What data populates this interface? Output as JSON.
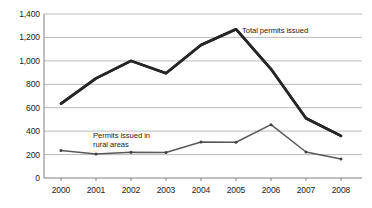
{
  "chart_data": {
    "type": "line",
    "title": "",
    "subtitle": "",
    "xlabel": "",
    "ylabel": "",
    "categories": [
      "2000",
      "2001",
      "2002",
      "2003",
      "2004",
      "2005",
      "2006",
      "2007",
      "2008"
    ],
    "ylim": [
      0,
      1400
    ],
    "yticks": [
      0,
      200,
      400,
      600,
      800,
      1000,
      1200,
      1400
    ],
    "ytick_labels": [
      "0",
      "200",
      "400",
      "600",
      "800",
      "1,000",
      "1,200",
      "1,400"
    ],
    "grid": true,
    "grid_axis": "y",
    "legend": "none",
    "annotations": [
      {
        "text": "Total permits issued",
        "series": "Total permits issued"
      },
      {
        "text": "Permits issued in\nrural areas",
        "series": "Permits issued in rural areas"
      }
    ],
    "series": [
      {
        "name": "Total permits issued",
        "color": "#262626",
        "values": [
          635,
          850,
          1000,
          895,
          1135,
          1270,
          930,
          510,
          360
        ]
      },
      {
        "name": "Permits issued in rural areas",
        "color": "#595959",
        "values": [
          235,
          205,
          220,
          218,
          308,
          305,
          455,
          222,
          162
        ]
      }
    ]
  },
  "axis": {
    "y_labels": [
      "1,400",
      "1,200",
      "1,000",
      "800",
      "600",
      "400",
      "200",
      "0"
    ],
    "x_labels": [
      "2000",
      "2001",
      "2002",
      "2003",
      "2004",
      "2005",
      "2006",
      "2007",
      "2008"
    ]
  },
  "annotations": {
    "total_label": "Total permits issued",
    "rural_label_line1": "Permits issued in",
    "rural_label_line2": "rural areas"
  },
  "colors": {
    "total_series": "#262626",
    "rural_series": "#595959",
    "gridline": "#b3b3b3",
    "axis": "#808080",
    "background": "#ffffff",
    "text": "#1a1a1a"
  }
}
